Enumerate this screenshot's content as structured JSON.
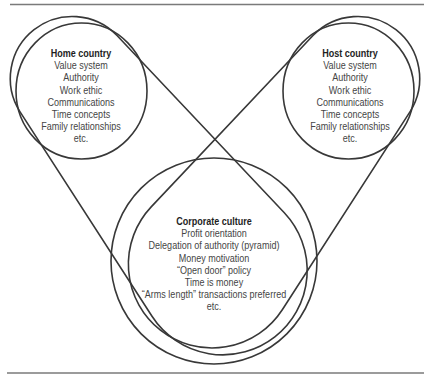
{
  "diagram": {
    "home": {
      "title": "Home country",
      "items": [
        "Value system",
        "Authority",
        "Work ethic",
        "Communications",
        "Time concepts",
        "Family relationships",
        "etc."
      ]
    },
    "host": {
      "title": "Host country",
      "items": [
        "Value system",
        "Authority",
        "Work ethic",
        "Communications",
        "Time concepts",
        "Family relationships",
        "etc."
      ]
    },
    "corporate": {
      "title": "Corporate culture",
      "items": [
        "Profit orientation",
        "Delegation of authority (pyramid)",
        "Money motivation",
        "“Open door” policy",
        "Time is money",
        "“Arms length” transactions preferred",
        "etc."
      ]
    }
  },
  "colors": {
    "line": "#383838",
    "rule": "#7a7a7a",
    "text": "#454545",
    "background": "#ffffff"
  }
}
